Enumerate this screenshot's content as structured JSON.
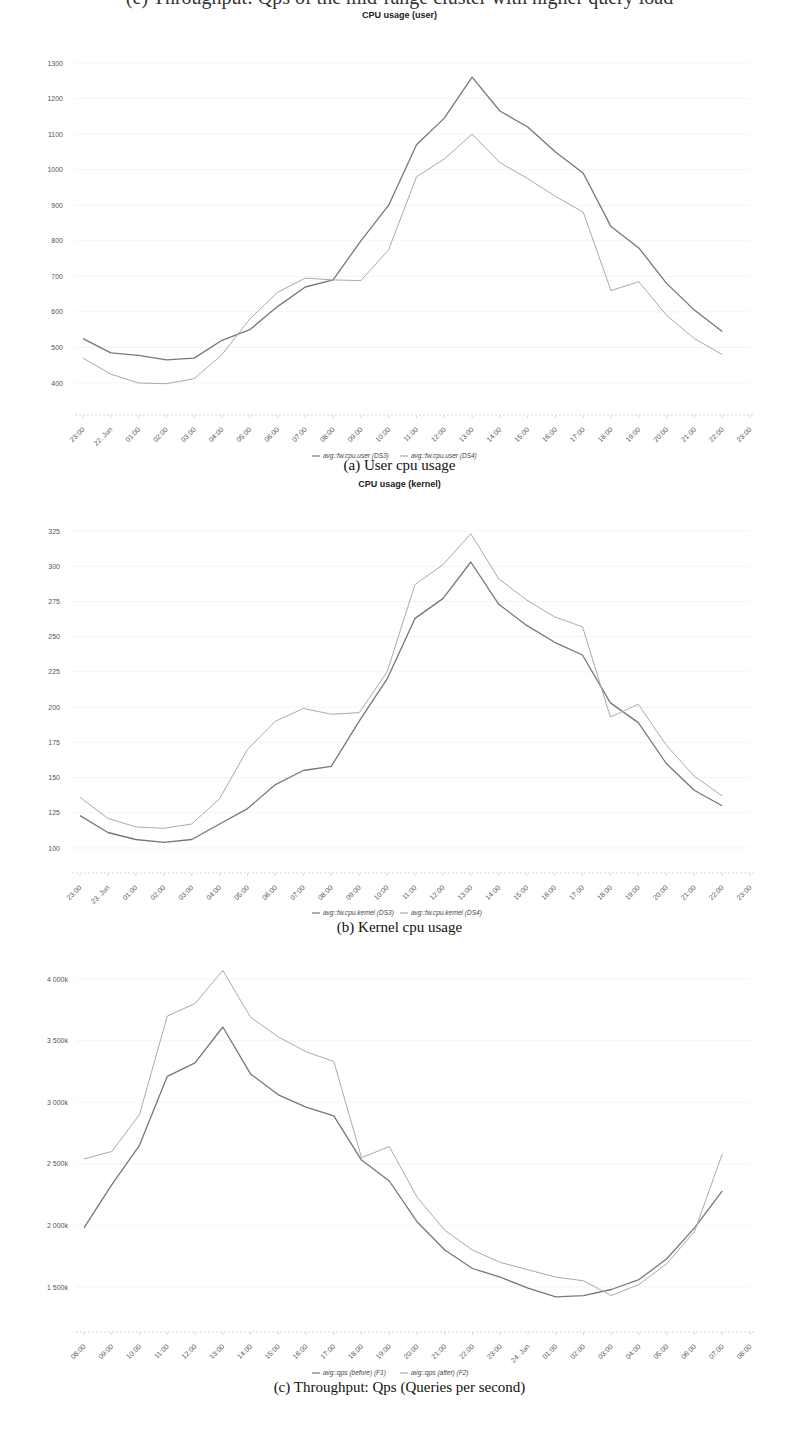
{
  "page": {
    "cutoff_text": "(e) Throughput: Qps of the mid-range cluster with higher query load"
  },
  "chart_data": [
    {
      "id": "user",
      "type": "line",
      "title": "CPU usage (user)",
      "caption": "(a) User cpu usage",
      "xlabel": "",
      "ylabel": "",
      "categories": [
        "23:00",
        "22. Jun",
        "01:00",
        "02:00",
        "03:00",
        "04:00",
        "05:00",
        "06:00",
        "07:00",
        "08:00",
        "09:00",
        "10:00",
        "11:00",
        "12:00",
        "13:00",
        "14:00",
        "15:00",
        "16:00",
        "17:00",
        "18:00",
        "19:00",
        "20:00",
        "21:00",
        "22:00",
        "23:00"
      ],
      "yticks": [
        400,
        500,
        600,
        700,
        800,
        900,
        1000,
        1100,
        1200,
        1300
      ],
      "ytick_labels": [
        "400",
        "500",
        "600",
        "700",
        "800",
        "900",
        "1000",
        "1100",
        "1200",
        "1300"
      ],
      "ylim": [
        400,
        1300
      ],
      "grid": true,
      "legend_position": "bottom",
      "series": [
        {
          "name": "avg::fw.cpu.user (DS3)",
          "color": "#777777",
          "width": 1.3,
          "values": [
            525,
            485,
            478,
            465,
            470,
            520,
            550,
            615,
            670,
            690,
            800,
            900,
            1070,
            1145,
            1260,
            1165,
            1120,
            1050,
            990,
            840,
            780,
            680,
            605,
            545
          ]
        },
        {
          "name": "avg::fw.cpu.user (DS4)",
          "color": "#aaaaaa",
          "width": 1.0,
          "values": [
            470,
            425,
            400,
            398,
            412,
            480,
            580,
            655,
            695,
            690,
            688,
            775,
            980,
            1030,
            1100,
            1020,
            975,
            925,
            880,
            660,
            685,
            590,
            525,
            480
          ]
        }
      ]
    },
    {
      "id": "kernel",
      "type": "line",
      "title": "CPU usage (kernel)",
      "caption": "(b) Kernel cpu usage",
      "xlabel": "",
      "ylabel": "",
      "categories": [
        "23:00",
        "23. Jun",
        "01:00",
        "02:00",
        "03:00",
        "04:00",
        "05:00",
        "06:00",
        "07:00",
        "08:00",
        "09:00",
        "10:00",
        "11:00",
        "12:00",
        "13:00",
        "14:00",
        "15:00",
        "16:00",
        "17:00",
        "18:00",
        "19:00",
        "20:00",
        "21:00",
        "22:00",
        "23:00"
      ],
      "yticks": [
        100,
        125,
        150,
        175,
        200,
        225,
        250,
        275,
        300,
        325
      ],
      "ytick_labels": [
        "100",
        "125",
        "150",
        "175",
        "200",
        "225",
        "250",
        "275",
        "300",
        "325"
      ],
      "ylim": [
        100,
        325
      ],
      "grid": true,
      "legend_position": "bottom",
      "series": [
        {
          "name": "avg::fw.cpu.kernel (DS3)",
          "color": "#777777",
          "width": 1.3,
          "values": [
            123,
            111,
            106,
            104,
            106,
            117,
            128,
            145,
            155,
            158,
            190,
            220,
            263,
            277,
            303,
            273,
            258,
            246,
            237,
            203,
            189,
            160,
            141,
            130
          ]
        },
        {
          "name": "avg::fw.cpu.kernel (DS4)",
          "color": "#aaaaaa",
          "width": 1.0,
          "values": [
            136,
            121,
            115,
            114,
            117,
            135,
            170,
            190,
            199,
            195,
            196,
            225,
            287,
            301,
            323,
            291,
            276,
            264,
            257,
            193,
            202,
            173,
            151,
            137
          ]
        }
      ]
    },
    {
      "id": "qps",
      "type": "line",
      "title": "",
      "caption": "(c) Throughput: Qps (Queries per second)",
      "xlabel": "",
      "ylabel": "",
      "categories": [
        "08:00",
        "09:00",
        "10:00",
        "11:00",
        "12:00",
        "13:00",
        "14:00",
        "15:00",
        "16:00",
        "17:00",
        "18:00",
        "19:00",
        "20:00",
        "21:00",
        "22:00",
        "23:00",
        "24. Jun",
        "01:00",
        "02:00",
        "03:00",
        "04:00",
        "05:00",
        "06:00",
        "07:00",
        "08:00"
      ],
      "yticks": [
        1500,
        2000,
        2500,
        3000,
        3500,
        4000
      ],
      "ytick_labels": [
        "1 500k",
        "2 000k",
        "2 500k",
        "3 000k",
        "3 500k",
        "4 000k"
      ],
      "ylim": [
        1500,
        4000
      ],
      "units": "k",
      "grid": true,
      "legend_position": "bottom",
      "series": [
        {
          "name": "avg::qps (before) (F1)",
          "color": "#777777",
          "width": 1.3,
          "values": [
            1980,
            2330,
            2650,
            3210,
            3320,
            3610,
            3230,
            3060,
            2960,
            2890,
            2530,
            2360,
            2030,
            1800,
            1650,
            1580,
            1490,
            1420,
            1430,
            1480,
            1560,
            1730,
            1980,
            2280
          ]
        },
        {
          "name": "avg::qps (after) (F2)",
          "color": "#aaaaaa",
          "width": 1.0,
          "values": [
            2540,
            2600,
            2900,
            3700,
            3800,
            4070,
            3690,
            3530,
            3410,
            3330,
            2550,
            2640,
            2230,
            1960,
            1800,
            1700,
            1640,
            1580,
            1550,
            1430,
            1520,
            1690,
            1950,
            2580
          ]
        }
      ]
    }
  ],
  "layout": [
    {
      "top": 0,
      "height": 470,
      "title_y": 16,
      "plot_top": 63,
      "plot_bottom": 383,
      "axis_y": 415,
      "xlab_y": 430,
      "legend_y": 458,
      "caption_y": 470,
      "x0": 83,
      "x1": 750,
      "ylab_x": 63
    },
    {
      "top": 0,
      "height": 940,
      "title_y": 486,
      "plot_top": 531,
      "plot_bottom": 848,
      "axis_y": 873,
      "xlab_y": 888,
      "legend_y": 915,
      "caption_y": 929,
      "x0": 80,
      "x1": 750,
      "ylab_x": 60
    },
    {
      "top": 0,
      "height": 1436,
      "title_y": -1,
      "plot_top": 979,
      "plot_bottom": 1287,
      "axis_y": 1332,
      "xlab_y": 1347,
      "legend_y": 1375,
      "caption_y": 1389,
      "x0": 84,
      "x1": 750,
      "ylab_x": 68
    }
  ]
}
